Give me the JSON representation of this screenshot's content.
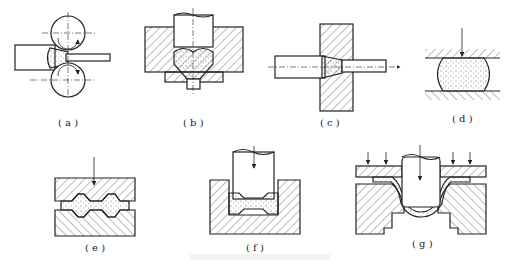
{
  "figure": {
    "panels": [
      {
        "id": "a",
        "label": "( a )",
        "description": "rolling - workpiece between two rotating rolls"
      },
      {
        "id": "b",
        "label": "( b )",
        "description": "extrusion through a die with punch"
      },
      {
        "id": "c",
        "label": "( c )",
        "description": "drawing - rod pulled through a die"
      },
      {
        "id": "d",
        "label": "( d )",
        "description": "free forging (upsetting) between flat platens"
      },
      {
        "id": "e",
        "label": "( e )",
        "description": "closed-die forging with upper and lower dies"
      },
      {
        "id": "f",
        "label": "( f )",
        "description": "die forging with punch in a cavity"
      },
      {
        "id": "g",
        "label": "( g )",
        "description": "sheet metal deep drawing with blank holder"
      }
    ],
    "caption": ""
  },
  "colors": {
    "line": "#222222",
    "hatch": "#555555",
    "dots": "#444444",
    "background": "#ffffff"
  }
}
